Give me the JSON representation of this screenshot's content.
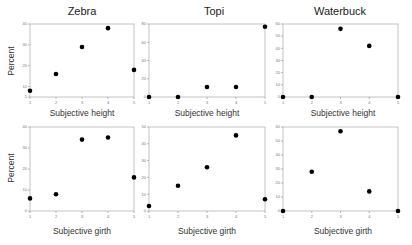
{
  "chart_data": [
    {
      "type": "scatter",
      "title": "Zebra",
      "xlabel": "Subjective height",
      "ylabel": "Percent",
      "x": [
        1,
        2,
        3,
        4,
        5
      ],
      "values": [
        8,
        16,
        29,
        38,
        18
      ],
      "yticks": [
        5,
        10,
        20,
        30,
        40
      ],
      "ylim": [
        5,
        40
      ],
      "xlim": [
        1,
        5
      ],
      "grid": false
    },
    {
      "type": "scatter",
      "title": "Topi",
      "xlabel": "Subjective height",
      "ylabel": "",
      "x": [
        1,
        2,
        3,
        4,
        5
      ],
      "values": [
        0,
        0,
        11,
        11,
        77
      ],
      "yticks": [
        0,
        20,
        40,
        60,
        80
      ],
      "ylim": [
        0,
        80
      ],
      "xlim": [
        1,
        5
      ],
      "grid": false
    },
    {
      "type": "scatter",
      "title": "Waterbuck",
      "xlabel": "Subjective height",
      "ylabel": "",
      "x": [
        1,
        2,
        3,
        4,
        5
      ],
      "values": [
        0,
        0,
        56,
        42,
        0
      ],
      "yticks": [
        0,
        10,
        20,
        30,
        40,
        50,
        60
      ],
      "ylim": [
        0,
        60
      ],
      "xlim": [
        1,
        5
      ],
      "grid": false
    },
    {
      "type": "scatter",
      "title": "",
      "xlabel": "Subjective girth",
      "ylabel": "Percent",
      "x": [
        1,
        2,
        3,
        4,
        5
      ],
      "values": [
        6,
        8,
        34,
        35,
        16
      ],
      "yticks": [
        0,
        10,
        20,
        30,
        40
      ],
      "ylim": [
        0,
        40
      ],
      "xlim": [
        1,
        5
      ],
      "grid": false
    },
    {
      "type": "scatter",
      "title": "",
      "xlabel": "Subjective girth",
      "ylabel": "",
      "x": [
        1,
        2,
        3,
        4,
        5
      ],
      "values": [
        3,
        15,
        26,
        45,
        7
      ],
      "yticks": [
        0,
        10,
        20,
        30,
        40,
        50
      ],
      "ylim": [
        0,
        50
      ],
      "xlim": [
        1,
        5
      ],
      "grid": false
    },
    {
      "type": "scatter",
      "title": "",
      "xlabel": "Subjective girth",
      "ylabel": "",
      "x": [
        1,
        2,
        3,
        4,
        5
      ],
      "values": [
        0,
        28,
        57,
        14,
        0
      ],
      "yticks": [
        0,
        10,
        20,
        30,
        40,
        50,
        60
      ],
      "ylim": [
        0,
        60
      ],
      "xlim": [
        1,
        5
      ],
      "grid": false
    }
  ],
  "panels": {
    "zebra_height": {
      "title": "Zebra",
      "xlabel": "Subjective height",
      "ylabel": "Percent"
    },
    "topi_height": {
      "title": "Topi",
      "xlabel": "Subjective height"
    },
    "waterbuck_height": {
      "title": "Waterbuck",
      "xlabel": "Subjective height"
    },
    "zebra_girth": {
      "xlabel": "Subjective girth",
      "ylabel": "Percent"
    },
    "topi_girth": {
      "xlabel": "Subjective girth"
    },
    "waterbuck_girth": {
      "xlabel": "Subjective girth"
    }
  }
}
